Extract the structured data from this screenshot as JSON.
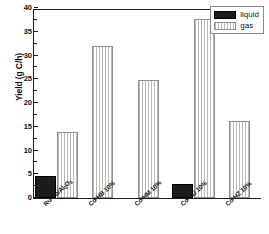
{
  "chart_data": {
    "type": "bar",
    "title": "",
    "xlabel": "",
    "ylabel": "Yield (g C/h)",
    "ylim": [
      0,
      40
    ],
    "ytick_values": [
      0,
      5,
      10,
      15,
      20,
      25,
      30,
      35,
      40
    ],
    "ytick_labels": [
      "0",
      "5",
      "10",
      "15",
      "20",
      "25",
      "30",
      "35",
      "40"
    ],
    "grid": false,
    "legend_position": "top-right",
    "categories": [
      "Ru-Co/Al2O3",
      "Co-HB 10%",
      "Co-HM 10%",
      "Co-HU 10%",
      "Co-HZ 10%"
    ],
    "category_labels_html": [
      "Ru-Co/Al<sub>2</sub>O<sub>3</sub>",
      "Co-HB 10%",
      "Co-HM 10%",
      "Co-HU 10%",
      "Co-HZ 10%"
    ],
    "series": [
      {
        "name": "liquid",
        "color": "#1c1c1c",
        "fill": "solid-black",
        "values": [
          4.7,
          0,
          0,
          2.9,
          0
        ]
      },
      {
        "name": "gas",
        "color": "#b9b9b9",
        "fill": "vertical-hatch",
        "values": [
          13.9,
          31.9,
          24.8,
          37.6,
          16.3
        ]
      }
    ]
  },
  "legend": {
    "items": [
      {
        "label": "liquid",
        "swatch": "solid-black"
      },
      {
        "label": "gas",
        "swatch": "vertical-hatch"
      }
    ]
  },
  "axes": {
    "y_title": "Yield (g C/h)"
  }
}
